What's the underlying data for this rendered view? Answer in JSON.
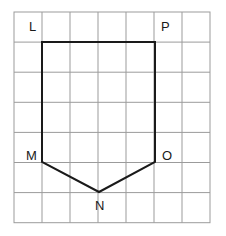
{
  "figure": {
    "type": "geometry-grid-diagram",
    "shape_name": "pentagon LMNOP",
    "canvas": {
      "width": 226,
      "height": 236,
      "background": "#ffffff"
    },
    "grid": {
      "origin_x": 14,
      "origin_y": 12,
      "cell_width": 28,
      "cell_height": 30.1,
      "columns": 7,
      "rows": 7,
      "line_color": "#9b9b9b",
      "line_width": 1,
      "border_color": "#9b9b9b",
      "border_width": 1
    },
    "shape": {
      "stroke_color": "#1a1a1a",
      "stroke_width": 2,
      "fill": "none",
      "closed": true,
      "points_px": [
        [
          42,
          42
        ],
        [
          42,
          162
        ],
        [
          99,
          192
        ],
        [
          155,
          162
        ],
        [
          155,
          42
        ]
      ],
      "points_grid": [
        [
          1,
          1
        ],
        [
          1,
          5
        ],
        [
          3,
          6
        ],
        [
          5,
          5
        ],
        [
          5,
          1
        ]
      ]
    },
    "vertices": [
      {
        "id": "L",
        "label": "L",
        "x": 42,
        "y": 42,
        "label_x": 29,
        "label_y": 20
      },
      {
        "id": "M",
        "label": "M",
        "x": 42,
        "y": 162,
        "label_x": 26,
        "label_y": 149
      },
      {
        "id": "N",
        "label": "N",
        "x": 99,
        "y": 192,
        "label_x": 95,
        "label_y": 199
      },
      {
        "id": "O",
        "label": "O",
        "x": 155,
        "y": 162,
        "label_x": 162,
        "label_y": 149
      },
      {
        "id": "P",
        "label": "P",
        "x": 155,
        "y": 42,
        "label_x": 161,
        "label_y": 20
      }
    ]
  }
}
